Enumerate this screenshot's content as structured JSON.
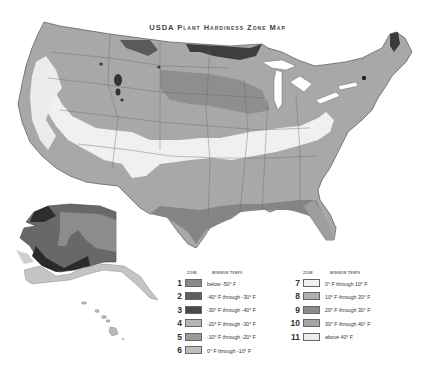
{
  "title": "USDA Plant Hardiness Zone Map",
  "colors": {
    "background": "#ffffff",
    "border": "#555555"
  },
  "legend": {
    "zone_header": "Zone",
    "temp_header": "Minimum Temps",
    "left": [
      {
        "zone": "1",
        "label": "below -50° F",
        "color": "#8a8a8a"
      },
      {
        "zone": "2",
        "label": "-40° F through -30° F",
        "color": "#5e5e5e"
      },
      {
        "zone": "3",
        "label": "-30° F through -40° F",
        "color": "#4a4a4a"
      },
      {
        "zone": "4",
        "label": "-20° F through -30° F",
        "color": "#b4b4b4"
      },
      {
        "zone": "5",
        "label": "-10° F through -20° F",
        "color": "#9a9a9a"
      },
      {
        "zone": "6",
        "label": "0° F through -10° F",
        "color": "#bdbdbd"
      }
    ],
    "right": [
      {
        "zone": "7",
        "label": "0° F through 10° F",
        "color": "#f2f2f2"
      },
      {
        "zone": "8",
        "label": "10° F through 20° F",
        "color": "#b0b0b0"
      },
      {
        "zone": "9",
        "label": "20° F through 30° F",
        "color": "#8c8c8c"
      },
      {
        "zone": "10",
        "label": "30° F through 40° F",
        "color": "#a6a6a6"
      },
      {
        "zone": "11",
        "label": "above 40° F",
        "color": "#ececec"
      }
    ]
  },
  "insets": [
    "Alaska",
    "Hawaii"
  ]
}
